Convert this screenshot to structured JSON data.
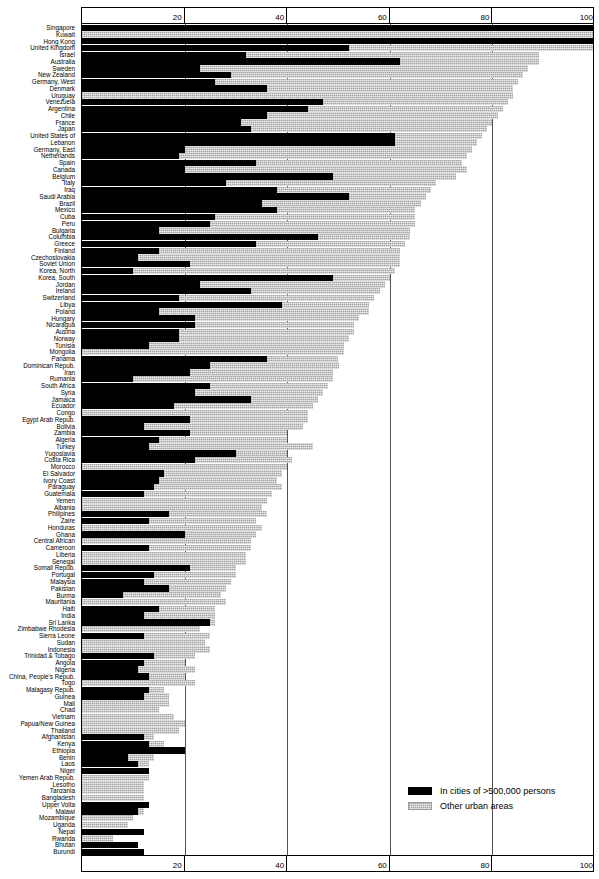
{
  "chart_data": {
    "type": "bar",
    "orientation": "horizontal-stacked",
    "title": "",
    "xlabel": "",
    "ylabel": "",
    "xlim": [
      0,
      100
    ],
    "xticks": [
      20,
      40,
      60,
      80,
      100
    ],
    "grid": true,
    "legend_position": "bottom-right",
    "series": [
      {
        "name": "In cities of  >500,000 persons",
        "color": "#000000",
        "key": "big"
      },
      {
        "name": "Other urban areas",
        "color": "#c8c8c8",
        "key": "other"
      }
    ],
    "categories": [
      "Singapore",
      "Kuwait",
      "Hong Kong",
      "United Kingdom",
      "Israel",
      "Australia",
      "Sweden",
      "New Zealand",
      "Germany, West",
      "Denmark",
      "Uruguay",
      "Venezuela",
      "Argentina",
      "Chile",
      "France",
      "Japan",
      "United States of",
      "Lebanon",
      "Germany, East",
      "Netherlands",
      "Spain",
      "Canada",
      "Belgium",
      "Italy",
      "Iraq",
      "Saudi Arabia",
      "Brazil",
      "Mexico",
      "Cuba",
      "Peru",
      "Bulgaria",
      "Columbia",
      "Greece",
      "Finland",
      "Czechoslovakia",
      "Soviet Union",
      "Korea, North",
      "Korea, South",
      "Jordan",
      "Ireland",
      "Switzerland",
      "Libya",
      "Poland",
      "Hungary",
      "Nicaragua",
      "Austria",
      "Norway",
      "Tunisia",
      "Mongolia",
      "Panama",
      "Dominican Repub.",
      "Iran",
      "Rumania",
      "South Africa",
      "Syria",
      "Jamaica",
      "Ecuador",
      "Congo",
      "Egypt Arab Repub.",
      "Bolivia",
      "Zambia",
      "Algeria",
      "Turkey",
      "Yugoslavia",
      "Costa Rica",
      "Morocco",
      "El Salvador",
      "Ivory Coast",
      "Paraguay",
      "Guatemala",
      "Yemen",
      "Albania",
      "Philipines",
      "Zaire",
      "Honduras",
      "Ghana",
      "Central African",
      "Cameroon",
      "Liberia",
      "Senegal",
      "Somali Repub.",
      "Portugal",
      "Malaysia",
      "Pakistan",
      "Burma",
      "Mauritania",
      "Haiti",
      "India",
      "Sri Lanka",
      "Zimbabwe Rhodesia",
      "Sierra Leone",
      "Sudan",
      "Indonesia",
      "Trinidad & Tobago",
      "Angola",
      "Nigeria",
      "China, People's Repub.",
      "Togo",
      "Malagasy Repub.",
      "Guinea",
      "Mali",
      "Chad",
      "Vietnam",
      "Papua/New Guinea",
      "Thailand",
      "Afghanistan",
      "Kenya",
      "Ethiopia",
      "Benin",
      "Laos",
      "Niger",
      "Yemen Arab Repub.",
      "Lesotho",
      "Tanzania",
      "Bangladesh",
      "Upper Volta",
      "Malawi",
      "Mozambique",
      "Uganda",
      "Nepal",
      "Rwanda",
      "Bhutan",
      "Burundi"
    ],
    "big_city_share": [
      100,
      0,
      100,
      52,
      32,
      62,
      23,
      29,
      26,
      36,
      0,
      47,
      44,
      36,
      31,
      33,
      61,
      61,
      20,
      19,
      34,
      20,
      49,
      28,
      38,
      52,
      35,
      38,
      26,
      25,
      15,
      46,
      34,
      15,
      11,
      21,
      10,
      49,
      23,
      33,
      19,
      39,
      15,
      22,
      22,
      19,
      19,
      13,
      0,
      36,
      25,
      21,
      10,
      25,
      22,
      33,
      18,
      0,
      21,
      12,
      21,
      15,
      13,
      30,
      22,
      0,
      16,
      15,
      14,
      12,
      0,
      0,
      17,
      13,
      0,
      20,
      0,
      13,
      0,
      0,
      21,
      14,
      12,
      17,
      8,
      0,
      15,
      12,
      25,
      0,
      12,
      0,
      0,
      14,
      12,
      11,
      13,
      0,
      13,
      12,
      0,
      0,
      0,
      0,
      0,
      12,
      13,
      20,
      9,
      11,
      13,
      0,
      0,
      0,
      0,
      13,
      11,
      0,
      0,
      12,
      0,
      11,
      12,
      0,
      0,
      0
    ],
    "total_urban_share": [
      100,
      100,
      100,
      100,
      89,
      89,
      87,
      86,
      85,
      84,
      84,
      83,
      82,
      81,
      80,
      79,
      78,
      77,
      76,
      75,
      74,
      75,
      73,
      69,
      68,
      67,
      66,
      65,
      65,
      65,
      64,
      64,
      63,
      62,
      62,
      62,
      61,
      60,
      59,
      58,
      57,
      56,
      56,
      54,
      53,
      53,
      52,
      51,
      51,
      50,
      50,
      49,
      49,
      48,
      47,
      46,
      45,
      44,
      44,
      43,
      40,
      40,
      45,
      40,
      41,
      40,
      39,
      38,
      39,
      37,
      36,
      35,
      36,
      34,
      35,
      34,
      33,
      33,
      32,
      32,
      30,
      30,
      29,
      28,
      27,
      28,
      26,
      26,
      26,
      23,
      25,
      24,
      25,
      22,
      20,
      22,
      20,
      22,
      16,
      17,
      17,
      15,
      18,
      20,
      19,
      14,
      16,
      15,
      14,
      13,
      12,
      13,
      12,
      12,
      12,
      12,
      12,
      10,
      9,
      9,
      6,
      6,
      5,
      5,
      4
    ]
  },
  "legend": {
    "items": [
      {
        "label": "In cities of  >500,000 persons"
      },
      {
        "label": "Other urban areas"
      }
    ]
  },
  "axis": {
    "ticks": [
      "20",
      "40",
      "60",
      "80",
      "100"
    ]
  }
}
